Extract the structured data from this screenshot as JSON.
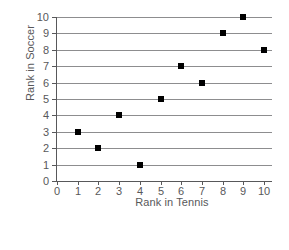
{
  "chart_data": {
    "type": "scatter",
    "title": "",
    "xlabel": "Rank in Tennis",
    "ylabel": "Rank in Soccer",
    "xlim": [
      0,
      10
    ],
    "ylim": [
      0,
      10
    ],
    "xticks": [
      "0",
      "1",
      "2",
      "3",
      "4",
      "5",
      "6",
      "7",
      "8",
      "9",
      "10"
    ],
    "yticks": [
      "0",
      "1",
      "2",
      "3",
      "4",
      "5",
      "6",
      "7",
      "8",
      "9",
      "10"
    ],
    "grid": "horizontal",
    "legend": null,
    "marker": "filled-square",
    "marker_color": "#000000",
    "grid_color": "#8d8d8f",
    "axis_color": "#58585a",
    "x": [
      1,
      2,
      3,
      4,
      5,
      6,
      7,
      8,
      9,
      10
    ],
    "y": [
      3,
      2,
      4,
      1,
      5,
      7,
      6,
      9,
      10,
      8
    ],
    "points": [
      {
        "x": 1,
        "y": 3
      },
      {
        "x": 2,
        "y": 2
      },
      {
        "x": 3,
        "y": 4
      },
      {
        "x": 4,
        "y": 1
      },
      {
        "x": 5,
        "y": 5
      },
      {
        "x": 6,
        "y": 7
      },
      {
        "x": 7,
        "y": 6
      },
      {
        "x": 8,
        "y": 9
      },
      {
        "x": 9,
        "y": 10
      },
      {
        "x": 10,
        "y": 8
      }
    ]
  }
}
